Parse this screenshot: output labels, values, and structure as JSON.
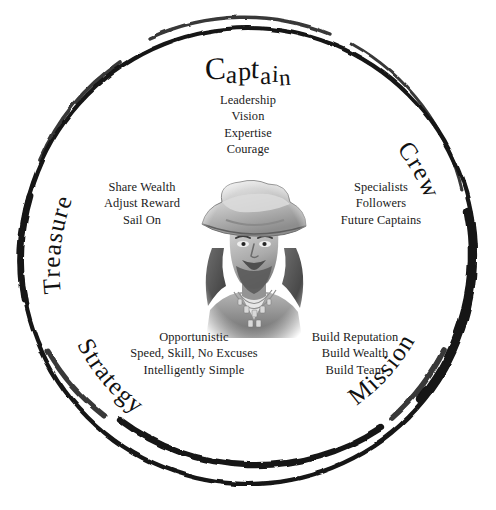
{
  "canvas": {
    "width": 496,
    "height": 510,
    "background": "#ffffff"
  },
  "colors": {
    "ink": "#111111",
    "ring": "#141414",
    "text": "#1a1a1a",
    "portrait_light": "#e9e9e9",
    "portrait_mid": "#9a9a9a",
    "portrait_dark": "#4a4a4a"
  },
  "center": {
    "illustration": "pirate-captain-portrait",
    "description": "grayscale pencil drawing of a bearded pirate captain wearing a tricorn hat with beaded necklaces"
  },
  "title": {
    "label": "Captain",
    "letters": [
      "C",
      "a",
      "p",
      "t",
      "a",
      "i",
      "n"
    ]
  },
  "rim_labels": [
    {
      "key": "treasure",
      "label": "Treasure",
      "position": "left",
      "orientation": "upright"
    },
    {
      "key": "crew",
      "label": "Crew",
      "position": "right",
      "orientation": "upright"
    },
    {
      "key": "strategy",
      "label": "Strategy",
      "position": "lower-left",
      "orientation": "inverted"
    },
    {
      "key": "mission",
      "label": "Mission",
      "position": "lower-right",
      "orientation": "inverted"
    }
  ],
  "quadrants": [
    {
      "key": "captain",
      "heading": "Captain",
      "items": [
        "Leadership",
        "Vision",
        "Expertise",
        "Courage"
      ]
    },
    {
      "key": "treasure",
      "heading": "Treasure",
      "items": [
        "Share Wealth",
        "Adjust Reward",
        "Sail On"
      ]
    },
    {
      "key": "crew",
      "heading": "Crew",
      "items": [
        "Specialists",
        "Followers",
        "Future Captains"
      ]
    },
    {
      "key": "strategy",
      "heading": "Strategy",
      "items": [
        "Opportunistic",
        "Speed, Skill, No Excuses",
        "Intelligently Simple"
      ]
    },
    {
      "key": "mission",
      "heading": "Mission",
      "items": [
        "Build Reputation",
        "Build Wealth",
        "Build Team"
      ]
    }
  ]
}
